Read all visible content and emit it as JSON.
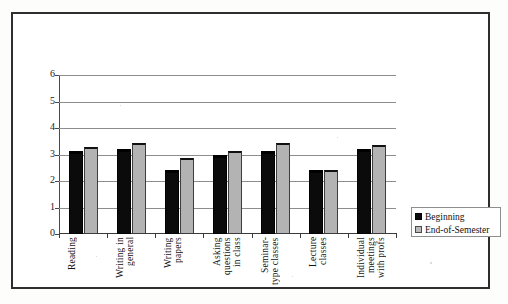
{
  "chart_data": {
    "type": "bar",
    "title": "",
    "xlabel": "",
    "ylabel": "",
    "ylim": [
      0,
      6
    ],
    "yticks": [
      "0",
      "1",
      "2",
      "3",
      "4",
      "5",
      "6"
    ],
    "grid": true,
    "legend_position": "bottom-right",
    "categories": [
      "Reading",
      "Writing in\ngeneral",
      "Writing\npapers",
      "Asking\nquestions\nin class",
      "Seminar-\ntype classes",
      "Lecture\nclasses",
      "Individual\nmeetings\nwith profs"
    ],
    "series": [
      {
        "name": "Beginning",
        "color": "#0b0b0b",
        "values": [
          3.15,
          3.2,
          2.4,
          3.0,
          3.15,
          2.4,
          3.2
        ]
      },
      {
        "name": "End-of-Semester",
        "color": "#b3b3b3",
        "values": [
          3.3,
          3.45,
          2.85,
          3.15,
          3.45,
          2.4,
          3.35
        ]
      }
    ]
  },
  "legend": {
    "items": [
      {
        "label": "Beginning",
        "swatch": "black-square-icon"
      },
      {
        "label": "End-of-Semester",
        "swatch": "gray-square-icon"
      }
    ]
  }
}
